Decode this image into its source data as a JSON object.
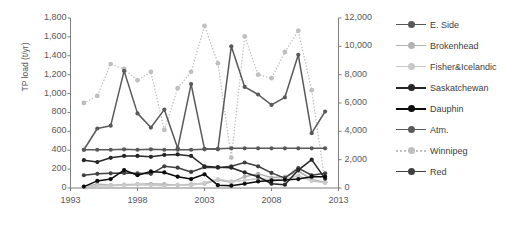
{
  "chart_data": {
    "type": "line",
    "title": "",
    "subtitle": "",
    "xlabel": "",
    "ylabel": "TP load (t/yr)",
    "y2label": "",
    "x": [
      1994,
      1995,
      1996,
      1997,
      1998,
      1999,
      2000,
      2001,
      2002,
      2003,
      2004,
      2005,
      2006,
      2007,
      2008,
      2009,
      2010,
      2011,
      2012
    ],
    "xlim": [
      1993,
      2013
    ],
    "xticks": [
      1993,
      1998,
      2003,
      2008,
      2013
    ],
    "xticklabels": [
      "1993",
      "1998",
      "2003",
      "2008",
      "2013"
    ],
    "ylim": [
      0,
      1800
    ],
    "yticks": [
      0,
      200,
      400,
      600,
      800,
      1000,
      1200,
      1400,
      1600,
      1800
    ],
    "yticklabels": [
      "0",
      "200",
      "400",
      "600",
      "800",
      "1,000",
      "1,200",
      "1,400",
      "1,600",
      "1,800"
    ],
    "y2lim": [
      0,
      12000
    ],
    "y2ticks": [
      0,
      2000,
      4000,
      6000,
      8000,
      10000,
      12000
    ],
    "y2ticklabels": [
      "0",
      "2,000",
      "4,000",
      "6,000",
      "8,000",
      "10,000",
      "12,000"
    ],
    "grid": false,
    "legend_position": "right",
    "series": [
      {
        "name": "E. Side",
        "axis": "left",
        "color": "#595959",
        "style": "solid",
        "marker": "circle",
        "values": [
          405,
          630,
          660,
          1240,
          790,
          640,
          830,
          420,
          1100,
          415,
          410,
          1500,
          1070,
          990,
          880,
          960,
          1410,
          580,
          810
        ]
      },
      {
        "name": "Brokenhead",
        "axis": "left",
        "color": "#b3b3b3",
        "style": "solid",
        "marker": "circle",
        "values": [
          15,
          40,
          30,
          35,
          40,
          45,
          40,
          30,
          40,
          45,
          85,
          60,
          120,
          150,
          110,
          120,
          180,
          90,
          60
        ]
      },
      {
        "name": "Fisher&Icelandic",
        "axis": "left",
        "color": "#c9c9c9",
        "style": "solid",
        "marker": "circle",
        "values": [
          10,
          20,
          25,
          30,
          35,
          30,
          25,
          35,
          30,
          55,
          95,
          70,
          80,
          100,
          90,
          95,
          130,
          75,
          55
        ]
      },
      {
        "name": "Saskatchewan",
        "axis": "left",
        "color": "#262626",
        "style": "solid",
        "marker": "circle",
        "values": [
          295,
          275,
          320,
          340,
          340,
          330,
          350,
          355,
          340,
          230,
          220,
          215,
          165,
          120,
          45,
          35,
          190,
          300,
          100
        ]
      },
      {
        "name": "Dauphin",
        "axis": "left",
        "color": "#0d0d0d",
        "style": "solid",
        "marker": "circle",
        "values": [
          15,
          75,
          95,
          190,
          135,
          175,
          165,
          120,
          95,
          145,
          30,
          25,
          45,
          70,
          80,
          85,
          95,
          120,
          120
        ]
      },
      {
        "name": "Atm.",
        "axis": "left",
        "color": "#595959",
        "style": "solid",
        "marker": "circle",
        "values": [
          405,
          405,
          405,
          410,
          405,
          410,
          405,
          405,
          405,
          410,
          415,
          420,
          420,
          420,
          420,
          420,
          420,
          420,
          420
        ]
      },
      {
        "name": "Winnipeg",
        "axis": "right",
        "color": "#bfbfbf",
        "style": "dotted",
        "marker": "circle",
        "values": [
          6000,
          6500,
          8750,
          8400,
          7600,
          8200,
          4100,
          7050,
          8200,
          11450,
          8800,
          2150,
          10700,
          8000,
          7750,
          9600,
          11100,
          6900,
          400
        ]
      },
      {
        "name": "Red",
        "axis": "left",
        "color": "#404040",
        "style": "solid",
        "marker": "circle",
        "values": [
          135,
          150,
          155,
          160,
          155,
          150,
          230,
          215,
          170,
          220,
          215,
          230,
          270,
          230,
          160,
          105,
          210,
          135,
          155
        ]
      }
    ]
  },
  "axes": {
    "y_left_title": "TP load (t/yr)"
  },
  "legend": {
    "items": [
      {
        "label": "E. Side"
      },
      {
        "label": "Brokenhead"
      },
      {
        "label": "Fisher&Icelandic"
      },
      {
        "label": "Saskatchewan"
      },
      {
        "label": "Dauphin"
      },
      {
        "label": "Atm."
      },
      {
        "label": "Winnipeg"
      },
      {
        "label": "Red"
      }
    ]
  }
}
